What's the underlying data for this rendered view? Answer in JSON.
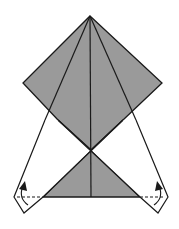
{
  "diagram": {
    "type": "origami-fold-step",
    "colors": {
      "paper_colored": "#9a9a9a",
      "paper_white": "#ffffff",
      "line": "#1a1a1a"
    },
    "elements": [
      {
        "name": "upper-kite-shaded",
        "description": "Shaded diamond / kite shape with central vertical crease"
      },
      {
        "name": "lower-triangle-shaded",
        "description": "Shaded triangle below crossing point"
      },
      {
        "name": "left-flap",
        "description": "White flap with valley-fold dashed line and curved arrow"
      },
      {
        "name": "right-flap",
        "description": "White flap with valley-fold dashed line and curved arrow"
      }
    ],
    "arrows": [
      {
        "name": "left-fold-arrow",
        "direction": "up"
      },
      {
        "name": "right-fold-arrow",
        "direction": "up"
      }
    ]
  }
}
